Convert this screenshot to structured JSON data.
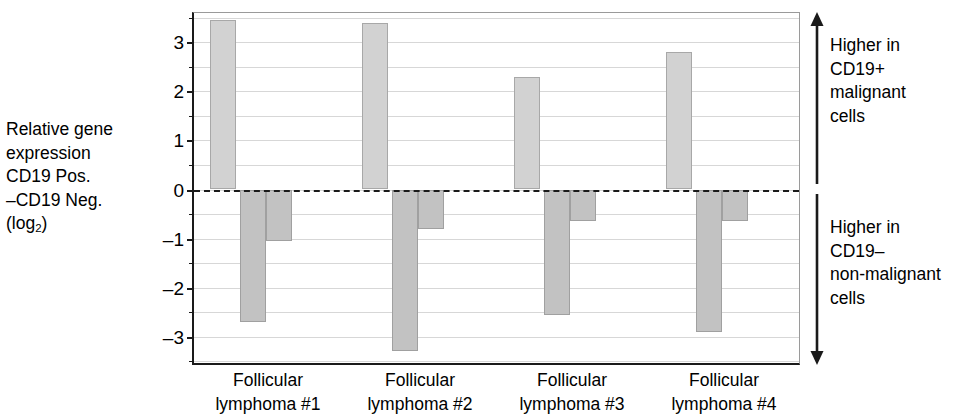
{
  "axis_label": {
    "line1": "Relative gene",
    "line2": "expression",
    "line3": "CD19 Pos.",
    "line4": "–CD19 Neg.",
    "line5_prefix": "(log",
    "line5_sub": "2",
    "line5_suffix": ")"
  },
  "annotations": {
    "top": [
      "Higher in",
      "CD19+",
      "malignant",
      "cells"
    ],
    "bottom": [
      "Higher in",
      "CD19–",
      "non-malignant",
      "cells"
    ]
  },
  "y_tick_labels": [
    "3",
    "2",
    "1",
    "0",
    "–1",
    "–2",
    "–3"
  ],
  "colors": {
    "positive_bar": "#d2d2d2",
    "negative_bar": "#c2c2c2",
    "axis": "#1a1a1a",
    "gridline": "#d7d7d7",
    "background": "#ffffff"
  },
  "chart_data": {
    "type": "bar",
    "title": "",
    "xlabel": "",
    "ylabel": "Relative gene expression CD19 Pos. –CD19 Neg. (log2)",
    "ylim": [
      -3.6,
      3.6
    ],
    "ytick_values": [
      3,
      2,
      1,
      0,
      -1,
      -2,
      -3
    ],
    "ytick_minor_step": 0.5,
    "grid": true,
    "legend": "none",
    "zero_reference_line": 0,
    "categories": [
      "Follicular lymphoma #1",
      "Follicular lymphoma #2",
      "Follicular lymphoma #3",
      "Follicular lymphoma #4"
    ],
    "category_lines": [
      [
        "Follicular",
        "lymphoma #1"
      ],
      [
        "Follicular",
        "lymphoma #2"
      ],
      [
        "Follicular",
        "lymphoma #3"
      ],
      [
        "Follicular",
        "lymphoma #4"
      ]
    ],
    "series": [
      {
        "name": "bar 1",
        "values": [
          3.45,
          3.4,
          2.3,
          2.8
        ]
      },
      {
        "name": "bar 2",
        "values": [
          -2.7,
          -3.3,
          -2.55,
          -2.9
        ]
      },
      {
        "name": "bar 3",
        "values": [
          -1.05,
          -0.8,
          -0.65,
          -0.65
        ]
      }
    ],
    "annotations": [
      {
        "text": "Higher in CD19+ malignant cells",
        "region": "above zero"
      },
      {
        "text": "Higher in CD19– non-malignant cells",
        "region": "below zero"
      }
    ]
  }
}
